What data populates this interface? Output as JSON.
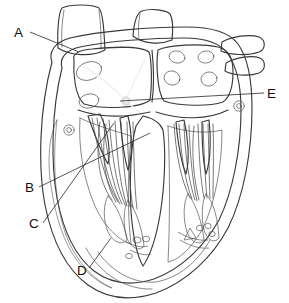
{
  "figure": {
    "type": "anatomical-diagram",
    "background_color": "#ffffff",
    "line_color": "#3a3a3a",
    "label_color": "#111111",
    "fill_colors": {
      "vessel_stump": "#b9b9b9",
      "myocardium_wall": "#c9c9c9",
      "chamber_cavity": "#dcdcdc",
      "septum": "#cfcfcf",
      "papillary_muscle": "#c4c4c4",
      "highlight": "#efefef"
    }
  },
  "labels": [
    {
      "id": "A",
      "text": "A",
      "text_x": 14,
      "text_y": 37,
      "leader": "M 30 32 L 79 52",
      "target": "aorta / great vessel at superior heart border"
    },
    {
      "id": "B",
      "text": "B",
      "text_x": 25,
      "text_y": 192,
      "leader": "M 39 187 L 150 133",
      "target": "interventricular septum"
    },
    {
      "id": "C",
      "text": "C",
      "text_x": 29,
      "text_y": 228,
      "leader": "M 43 223 L 114 123",
      "target": "atrioventricular valve cusp / chordae tendineae"
    },
    {
      "id": "D",
      "text": "D",
      "text_x": 77,
      "text_y": 275,
      "leader": "M 89 268 L 111 238",
      "target": "left ventricular myocardial wall"
    },
    {
      "id": "E",
      "text": "E",
      "text_x": 267,
      "text_y": 98,
      "leader": "M 264 93 L 120 101",
      "target": "interatrial septum region"
    }
  ],
  "annotations": {
    "label_font_size_px": 13.5,
    "leader_stroke_width": 0.8,
    "label_count": 5,
    "label_letters": [
      "A",
      "B",
      "C",
      "D",
      "E"
    ]
  }
}
